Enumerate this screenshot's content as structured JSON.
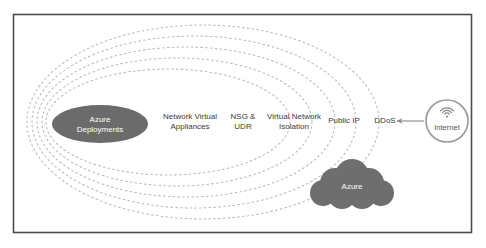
{
  "diagram": {
    "frame": {
      "border_color": "#4d4d4d",
      "background": "#ffffff"
    },
    "layer_labels": [
      {
        "id": "network-virtual-appliances",
        "text": "Network Virtual\nAppliances",
        "x": 190,
        "y": 121
      },
      {
        "id": "nsg-udr",
        "text": "NSG &\nUDR",
        "x": 243,
        "y": 121
      },
      {
        "id": "virtual-network-isolation",
        "text": "Virtual Network\nIsolation",
        "x": 294,
        "y": 121
      },
      {
        "id": "public-ip",
        "text": "Public IP",
        "x": 344,
        "y": 121
      },
      {
        "id": "ddos",
        "text": "DDoS",
        "x": 385,
        "y": 121
      }
    ],
    "core": {
      "id": "azure-deployments",
      "text": "Azure\nDeployments",
      "fill": "#6b6b6b",
      "cx": 100,
      "cy": 124,
      "rx": 48,
      "ry": 19
    },
    "cloud": {
      "id": "azure-cloud",
      "text": "Azure",
      "fill": "#6e6e6e",
      "cx": 352,
      "cy": 187
    },
    "internet": {
      "id": "internet-node",
      "text": "Internet",
      "icon": "wifi-icon",
      "ring_color": "#9a9a9a",
      "cx": 447,
      "cy": 121,
      "r": 21
    },
    "arrow": {
      "id": "internet-to-ddos-arrow",
      "color": "#8a8a8a",
      "from_x": 424,
      "to_x": 397,
      "y": 121
    },
    "rings": {
      "dash_color": "#b9b9b9",
      "ellipses": [
        {
          "cx": 168,
          "cy": 122,
          "rx": 122,
          "ry": 53
        },
        {
          "cx": 177,
          "cy": 122,
          "rx": 135,
          "ry": 64
        },
        {
          "cx": 186,
          "cy": 122,
          "rx": 149,
          "ry": 75
        },
        {
          "cx": 194,
          "cy": 122,
          "rx": 162,
          "ry": 86
        },
        {
          "cx": 203,
          "cy": 122,
          "rx": 176,
          "ry": 97
        }
      ]
    }
  }
}
